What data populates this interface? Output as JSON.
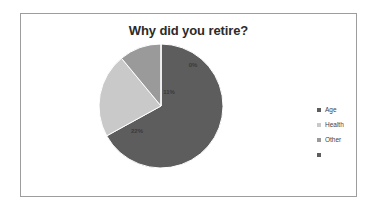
{
  "chart_data": {
    "type": "pie",
    "title": "Why did you retire?",
    "categories": [
      "Age",
      "Health",
      "Other",
      ""
    ],
    "values": [
      67,
      22,
      11,
      0
    ],
    "data_labels": [
      "67%",
      "22%",
      "11%",
      "0%"
    ],
    "colors": [
      "#5d5d5d",
      "#c9c9c9",
      "#9a9a9a",
      "#5d5d5d"
    ],
    "legend_position": "right",
    "legend_entries": [
      "Age",
      "Health",
      "Other",
      ""
    ],
    "start_angle_deg": 0,
    "direction": "clockwise",
    "grid": false,
    "xlabel": "",
    "ylabel": ""
  },
  "frame": {
    "border_color": "#9d9d9d",
    "background": "#ffffff"
  }
}
